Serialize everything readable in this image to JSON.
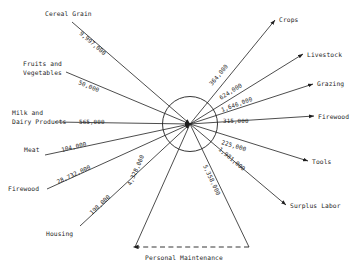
{
  "diagram": {
    "hub": {
      "cx": 190,
      "cy": 124,
      "r": 27.5
    },
    "inputs": [
      {
        "name": "Cereal Grain",
        "label": "Cereal Grain",
        "value": "9,997,000",
        "label2": ""
      },
      {
        "name": "Fruits and Vegetables",
        "label": "Fruits and",
        "label2": "Vegetables",
        "value": "50,000"
      },
      {
        "name": "Milk and Dairy Products",
        "label": "Milk and",
        "label2": "Dairy Products",
        "value": "565,000"
      },
      {
        "name": "Meat",
        "label": "Meat",
        "value": "104,000",
        "label2": ""
      },
      {
        "name": "Firewood",
        "label": "Firewood",
        "value": "28,732,000",
        "label2": ""
      },
      {
        "name": "Housing",
        "label": "Housing",
        "value": "198,000",
        "label2": ""
      }
    ],
    "outputs": [
      {
        "name": "Crops",
        "label": "Crops",
        "value": "364,000"
      },
      {
        "name": "Livestock",
        "label": "Livestock",
        "value": "624,000"
      },
      {
        "name": "Grazing",
        "label": "Grazing",
        "value": "1,646,000"
      },
      {
        "name": "Firewood",
        "label": "Firewood",
        "value": "315,000"
      },
      {
        "name": "Tools",
        "label": "Tools",
        "value": "225,000"
      },
      {
        "name": "Surplus Labor",
        "label": "Surplus Labor",
        "value": "1,981,000"
      }
    ],
    "feedback": {
      "name": "Personal Maintenance",
      "label": "Personal Maintenance",
      "value": "4,328,000",
      "value_right": "5,358,000"
    },
    "colors": {
      "ink": "#1f1f1f",
      "background": "#ffffff"
    }
  }
}
